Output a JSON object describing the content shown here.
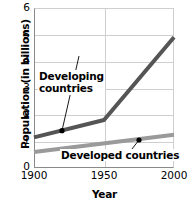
{
  "chart_data": {
    "type": "line",
    "title": "",
    "xlabel": "Year",
    "ylabel": "Population (in billions)",
    "xlim": [
      1900,
      2000
    ],
    "ylim": [
      0,
      6
    ],
    "xticks": [
      1900,
      1950,
      2000
    ],
    "yticks": [
      0,
      1,
      2,
      3,
      4,
      5,
      6
    ],
    "grid": true,
    "legend": "annotated-inline",
    "series": [
      {
        "name": "Developing countries",
        "color": "#555555",
        "x": [
          1900,
          1950,
          2000
        ],
        "values": [
          1.15,
          1.8,
          4.9
        ],
        "marker_points": [
          {
            "x": 1920,
            "y": 1.4
          }
        ]
      },
      {
        "name": "Developed countries",
        "color": "#9a9a9a",
        "x": [
          1900,
          2000
        ],
        "values": [
          0.6,
          1.25
        ],
        "marker_points": [
          {
            "x": 1975,
            "y": 1.05
          }
        ]
      }
    ],
    "annotations": [
      {
        "id": "developing",
        "line1": "Developing",
        "line2": "countries",
        "points_to": {
          "x": 1920,
          "y": 1.4
        }
      },
      {
        "id": "developed",
        "line1": "Developed countries",
        "line2": "",
        "points_to": {
          "x": 1975,
          "y": 1.05
        }
      }
    ]
  },
  "axis": {
    "ylabel": "Population (in billions)",
    "xlabel": "Year",
    "yticks": [
      "6",
      "5",
      "4",
      "3",
      "2",
      "1",
      "0"
    ],
    "xticks": [
      "1900",
      "1950",
      "2000"
    ]
  },
  "annotations": {
    "developing_line1": "Developing",
    "developing_line2": "countries",
    "developed_line1": "Developed countries"
  }
}
